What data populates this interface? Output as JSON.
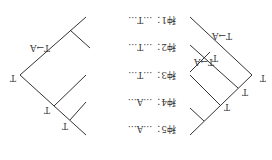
{
  "figure": {
    "orientation": "rotated 180 degrees",
    "line_color": "#333333",
    "rows": [
      {
        "label": "种1：",
        "seq": "…T…"
      },
      {
        "label": "种2：",
        "seq": "…T…"
      },
      {
        "label": "种3：",
        "seq": "…T…"
      },
      {
        "label": "种4：",
        "seq": "…A…"
      },
      {
        "label": "种5：",
        "seq": "…A…"
      }
    ],
    "tree_a": {
      "root_state": "T",
      "node_states": [
        "T",
        "T"
      ],
      "mutation": "T→A"
    },
    "tree_b": {
      "root_state": "T",
      "node_states": [
        "T",
        "T",
        "T"
      ],
      "mutations": [
        "T→A",
        "T→A"
      ]
    }
  }
}
